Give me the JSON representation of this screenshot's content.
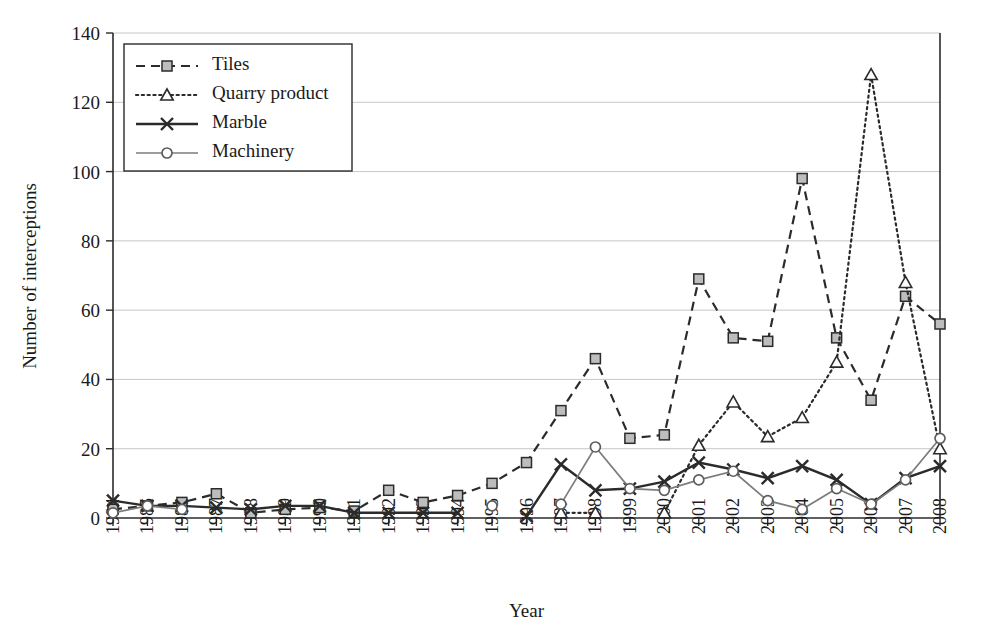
{
  "chart_data": {
    "type": "line",
    "title": "",
    "xlabel": "Year",
    "ylabel": "Number of interceptions",
    "xlim": [
      1984,
      2008
    ],
    "ylim": [
      0,
      140
    ],
    "ytick_step": 20,
    "yticks": [
      0,
      20,
      40,
      60,
      80,
      100,
      120,
      140
    ],
    "grid": "horizontal",
    "legend_position": "top-left",
    "categories": [
      "1984",
      "1985",
      "1986",
      "1987",
      "1988",
      "1989",
      "1990",
      "1991",
      "1992",
      "1993",
      "1994",
      "1995",
      "1996",
      "1997",
      "1998",
      "1999",
      "2000",
      "2001",
      "2002",
      "2003",
      "2004",
      "2005",
      "2006",
      "2007",
      "2008"
    ],
    "series": [
      {
        "name": "Tiles",
        "marker": "square",
        "line_style": "dashed",
        "color": "#2b2b2b",
        "values": [
          2.5,
          3.5,
          4.5,
          7,
          1.5,
          2.5,
          3,
          2,
          8,
          4.5,
          6.5,
          10,
          16,
          31,
          46,
          23,
          24,
          69,
          52,
          51,
          98,
          52,
          34,
          64,
          56
        ]
      },
      {
        "name": "Quarry product",
        "marker": "triangle",
        "line_style": "dotted",
        "color": "#2b2b2b",
        "values": [
          null,
          null,
          null,
          null,
          null,
          null,
          null,
          null,
          null,
          null,
          null,
          null,
          null,
          1.5,
          1.5,
          null,
          1.5,
          21,
          33.5,
          23.5,
          29,
          45,
          128,
          68,
          20
        ]
      },
      {
        "name": "Marble",
        "marker": "x",
        "line_style": "solid",
        "color": "#2b2b2b",
        "values": [
          5,
          3.5,
          3.5,
          3,
          2.5,
          3.5,
          3.5,
          1.5,
          1.5,
          1.5,
          1.5,
          null,
          0.5,
          15.5,
          8,
          8.5,
          10.5,
          16,
          14,
          11.5,
          15,
          11,
          4,
          11.5,
          15
        ]
      },
      {
        "name": "Machinery",
        "marker": "circle",
        "line_style": "solid-thin",
        "color": "#7d7d7d",
        "values": [
          1.5,
          3.5,
          2.5,
          null,
          null,
          null,
          null,
          null,
          null,
          null,
          null,
          3.5,
          null,
          4,
          20.5,
          8.5,
          8,
          11,
          13.5,
          5,
          2.5,
          8.5,
          4,
          11,
          23
        ]
      }
    ]
  },
  "legend": {
    "entries": [
      {
        "label": "Tiles"
      },
      {
        "label": "Quarry product"
      },
      {
        "label": "Marble"
      },
      {
        "label": "Machinery"
      }
    ]
  }
}
